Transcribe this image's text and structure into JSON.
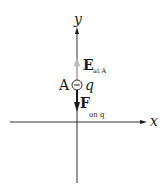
{
  "diagram": {
    "axes": {
      "x_label": "x",
      "y_label": "y"
    },
    "point_label": "A",
    "charge_label": "q",
    "charge_sign": "−",
    "field_vector": {
      "symbol": "E",
      "subscript": "at A",
      "direction": "up",
      "color": "#b8b8b8"
    },
    "force_vector": {
      "symbol": "F",
      "subscript": "on q",
      "direction": "down",
      "color": "#1a1a1a"
    },
    "axis_color": "#1a1a1a"
  }
}
